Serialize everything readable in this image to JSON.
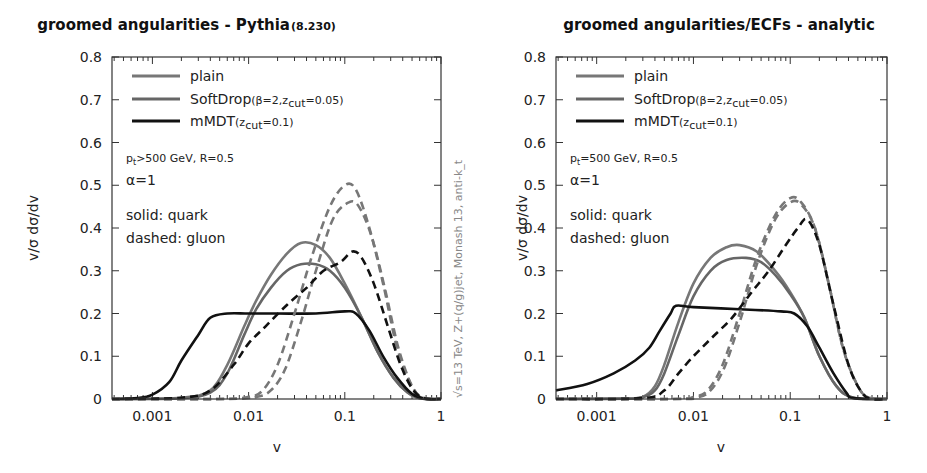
{
  "chart_data": [
    {
      "type": "line",
      "title": "groomed angularities - Pythia",
      "title_suffix": "(8.230)",
      "xlabel": "v",
      "ylabel": "v/σ dσ/dv",
      "xscale": "log",
      "xlim": [
        0.00038,
        1.0
      ],
      "ylim": [
        0,
        0.8
      ],
      "xticks": [
        "0.001",
        "0.01",
        "0.1",
        "1"
      ],
      "yticks": [
        "0",
        "0.1",
        "0.2",
        "0.3",
        "0.4",
        "0.5",
        "0.6",
        "0.7",
        "0.8"
      ],
      "legend": [
        {
          "label": "plain",
          "sub": "",
          "color": "#777777",
          "width": 3
        },
        {
          "label": "SoftDrop",
          "sub": "(β=2,z_cut=0.05)",
          "color": "#666666",
          "width": 3
        },
        {
          "label": "mMDT",
          "sub": "(z_cut=0.1)",
          "color": "#111111",
          "width": 3
        }
      ],
      "annotations": [
        "p_t>500 GeV, R=0.5",
        "α=1",
        "solid: quark",
        "dashed: gluon"
      ],
      "side_note": "√s=13 TeV, Z+(q/g)jet, Monash 13, anti-k_t",
      "series": [
        {
          "name": "plain quark",
          "color": "#777777",
          "dashed": false,
          "points": [
            [
              0.00038,
              0
            ],
            [
              0.002,
              0.003
            ],
            [
              0.004,
              0.02
            ],
            [
              0.006,
              0.08
            ],
            [
              0.009,
              0.17
            ],
            [
              0.012,
              0.23
            ],
            [
              0.017,
              0.29
            ],
            [
              0.025,
              0.34
            ],
            [
              0.035,
              0.365
            ],
            [
              0.05,
              0.36
            ],
            [
              0.07,
              0.33
            ],
            [
              0.1,
              0.27
            ],
            [
              0.15,
              0.19
            ],
            [
              0.22,
              0.11
            ],
            [
              0.32,
              0.05
            ],
            [
              0.45,
              0.015
            ],
            [
              0.6,
              0.002
            ],
            [
              1.0,
              0
            ]
          ]
        },
        {
          "name": "SoftDrop quark",
          "color": "#666666",
          "dashed": false,
          "points": [
            [
              0.00038,
              0
            ],
            [
              0.002,
              0.002
            ],
            [
              0.004,
              0.015
            ],
            [
              0.006,
              0.06
            ],
            [
              0.009,
              0.15
            ],
            [
              0.012,
              0.21
            ],
            [
              0.017,
              0.26
            ],
            [
              0.025,
              0.3
            ],
            [
              0.035,
              0.315
            ],
            [
              0.05,
              0.315
            ],
            [
              0.07,
              0.3
            ],
            [
              0.1,
              0.26
            ],
            [
              0.15,
              0.19
            ],
            [
              0.22,
              0.11
            ],
            [
              0.32,
              0.05
            ],
            [
              0.45,
              0.015
            ],
            [
              0.6,
              0.002
            ],
            [
              1.0,
              0
            ]
          ]
        },
        {
          "name": "mMDT quark",
          "color": "#111111",
          "dashed": false,
          "points": [
            [
              0.00038,
              0
            ],
            [
              0.0007,
              0.002
            ],
            [
              0.001,
              0.01
            ],
            [
              0.0015,
              0.04
            ],
            [
              0.002,
              0.09
            ],
            [
              0.003,
              0.15
            ],
            [
              0.004,
              0.19
            ],
            [
              0.006,
              0.2
            ],
            [
              0.01,
              0.2
            ],
            [
              0.02,
              0.2
            ],
            [
              0.05,
              0.2
            ],
            [
              0.1,
              0.205
            ],
            [
              0.13,
              0.2
            ],
            [
              0.18,
              0.16
            ],
            [
              0.25,
              0.1
            ],
            [
              0.35,
              0.05
            ],
            [
              0.5,
              0.012
            ],
            [
              0.7,
              0
            ],
            [
              1.0,
              0
            ]
          ]
        },
        {
          "name": "plain gluon",
          "color": "#777777",
          "dashed": true,
          "points": [
            [
              0.00038,
              0
            ],
            [
              0.005,
              0
            ],
            [
              0.01,
              0.005
            ],
            [
              0.014,
              0.02
            ],
            [
              0.02,
              0.08
            ],
            [
              0.03,
              0.2
            ],
            [
              0.045,
              0.33
            ],
            [
              0.07,
              0.45
            ],
            [
              0.1,
              0.5
            ],
            [
              0.13,
              0.49
            ],
            [
              0.18,
              0.4
            ],
            [
              0.25,
              0.27
            ],
            [
              0.35,
              0.12
            ],
            [
              0.5,
              0.03
            ],
            [
              0.65,
              0.003
            ],
            [
              1.0,
              0
            ]
          ]
        },
        {
          "name": "SoftDrop gluon",
          "color": "#777777",
          "dashed": true,
          "points": [
            [
              0.00038,
              0
            ],
            [
              0.006,
              0
            ],
            [
              0.012,
              0.005
            ],
            [
              0.017,
              0.02
            ],
            [
              0.024,
              0.07
            ],
            [
              0.035,
              0.18
            ],
            [
              0.05,
              0.3
            ],
            [
              0.075,
              0.42
            ],
            [
              0.11,
              0.46
            ],
            [
              0.14,
              0.45
            ],
            [
              0.19,
              0.38
            ],
            [
              0.26,
              0.26
            ],
            [
              0.36,
              0.12
            ],
            [
              0.5,
              0.03
            ],
            [
              0.65,
              0.003
            ],
            [
              1.0,
              0
            ]
          ]
        },
        {
          "name": "mMDT gluon",
          "color": "#111111",
          "dashed": true,
          "points": [
            [
              0.00038,
              0
            ],
            [
              0.002,
              0.003
            ],
            [
              0.004,
              0.02
            ],
            [
              0.007,
              0.08
            ],
            [
              0.01,
              0.13
            ],
            [
              0.015,
              0.17
            ],
            [
              0.025,
              0.22
            ],
            [
              0.04,
              0.26
            ],
            [
              0.06,
              0.3
            ],
            [
              0.09,
              0.32
            ],
            [
              0.12,
              0.345
            ],
            [
              0.15,
              0.33
            ],
            [
              0.2,
              0.27
            ],
            [
              0.28,
              0.17
            ],
            [
              0.38,
              0.08
            ],
            [
              0.5,
              0.025
            ],
            [
              0.65,
              0.002
            ],
            [
              1.0,
              0
            ]
          ]
        }
      ]
    },
    {
      "type": "line",
      "title": "groomed angularities/ECFs - analytic",
      "xlabel": "v",
      "ylabel": "v/σ dσ/dv",
      "xscale": "log",
      "xlim": [
        0.00038,
        1.0
      ],
      "ylim": [
        0,
        0.8
      ],
      "xticks": [
        "0.001",
        "0.01",
        "0.1",
        "1"
      ],
      "yticks": [
        "0",
        "0.1",
        "0.2",
        "0.3",
        "0.4",
        "0.5",
        "0.6",
        "0.7",
        "0.8"
      ],
      "legend": [
        {
          "label": "plain",
          "sub": "",
          "color": "#777777",
          "width": 3
        },
        {
          "label": "SoftDrop",
          "sub": "(β=2,z_cut=0.05)",
          "color": "#666666",
          "width": 3
        },
        {
          "label": "mMDT",
          "sub": "(z_cut=0.1)",
          "color": "#111111",
          "width": 3
        }
      ],
      "annotations": [
        "p_t=500 GeV, R=0.5",
        "α=1",
        "solid: quark",
        "dashed: gluon"
      ],
      "series": [
        {
          "name": "plain quark",
          "color": "#777777",
          "dashed": false,
          "points": [
            [
              0.00038,
              0
            ],
            [
              0.002,
              0.001
            ],
            [
              0.003,
              0.005
            ],
            [
              0.004,
              0.03
            ],
            [
              0.005,
              0.08
            ],
            [
              0.007,
              0.18
            ],
            [
              0.01,
              0.27
            ],
            [
              0.015,
              0.33
            ],
            [
              0.022,
              0.355
            ],
            [
              0.03,
              0.36
            ],
            [
              0.045,
              0.345
            ],
            [
              0.07,
              0.3
            ],
            [
              0.1,
              0.25
            ],
            [
              0.14,
              0.19
            ],
            [
              0.2,
              0.1
            ],
            [
              0.3,
              0.03
            ],
            [
              0.45,
              0.003
            ],
            [
              1.0,
              0
            ]
          ]
        },
        {
          "name": "SoftDrop quark",
          "color": "#666666",
          "dashed": false,
          "points": [
            [
              0.00038,
              0
            ],
            [
              0.002,
              0.001
            ],
            [
              0.003,
              0.004
            ],
            [
              0.004,
              0.02
            ],
            [
              0.005,
              0.06
            ],
            [
              0.007,
              0.15
            ],
            [
              0.01,
              0.24
            ],
            [
              0.015,
              0.3
            ],
            [
              0.022,
              0.325
            ],
            [
              0.035,
              0.33
            ],
            [
              0.05,
              0.32
            ],
            [
              0.07,
              0.29
            ],
            [
              0.1,
              0.245
            ],
            [
              0.14,
              0.19
            ],
            [
              0.2,
              0.1
            ],
            [
              0.3,
              0.03
            ],
            [
              0.45,
              0.003
            ],
            [
              1.0,
              0
            ]
          ]
        },
        {
          "name": "mMDT quark",
          "color": "#111111",
          "dashed": false,
          "points": [
            [
              0.00038,
              0.02
            ],
            [
              0.0008,
              0.035
            ],
            [
              0.0015,
              0.06
            ],
            [
              0.0025,
              0.09
            ],
            [
              0.0035,
              0.12
            ],
            [
              0.0045,
              0.16
            ],
            [
              0.0058,
              0.2
            ],
            [
              0.0066,
              0.218
            ],
            [
              0.01,
              0.215
            ],
            [
              0.03,
              0.21
            ],
            [
              0.08,
              0.205
            ],
            [
              0.11,
              0.2
            ],
            [
              0.15,
              0.17
            ],
            [
              0.2,
              0.12
            ],
            [
              0.28,
              0.06
            ],
            [
              0.38,
              0.015
            ],
            [
              0.45,
              0.002
            ],
            [
              1.0,
              0
            ]
          ]
        },
        {
          "name": "plain gluon",
          "color": "#777777",
          "dashed": true,
          "points": [
            [
              0.00038,
              0
            ],
            [
              0.006,
              0
            ],
            [
              0.01,
              0.005
            ],
            [
              0.014,
              0.02
            ],
            [
              0.02,
              0.08
            ],
            [
              0.03,
              0.2
            ],
            [
              0.045,
              0.33
            ],
            [
              0.07,
              0.43
            ],
            [
              0.1,
              0.47
            ],
            [
              0.13,
              0.46
            ],
            [
              0.18,
              0.4
            ],
            [
              0.25,
              0.27
            ],
            [
              0.35,
              0.12
            ],
            [
              0.5,
              0.03
            ],
            [
              0.65,
              0.003
            ],
            [
              1.0,
              0
            ]
          ]
        },
        {
          "name": "SoftDrop gluon",
          "color": "#777777",
          "dashed": true,
          "points": [
            [
              0.00038,
              0
            ],
            [
              0.007,
              0
            ],
            [
              0.011,
              0.004
            ],
            [
              0.015,
              0.02
            ],
            [
              0.021,
              0.075
            ],
            [
              0.031,
              0.19
            ],
            [
              0.046,
              0.32
            ],
            [
              0.07,
              0.42
            ],
            [
              0.1,
              0.46
            ],
            [
              0.13,
              0.455
            ],
            [
              0.18,
              0.4
            ],
            [
              0.25,
              0.27
            ],
            [
              0.35,
              0.12
            ],
            [
              0.5,
              0.03
            ],
            [
              0.65,
              0.003
            ],
            [
              1.0,
              0
            ]
          ]
        },
        {
          "name": "mMDT gluon",
          "color": "#111111",
          "dashed": true,
          "points": [
            [
              0.00038,
              0
            ],
            [
              0.003,
              0.002
            ],
            [
              0.005,
              0.02
            ],
            [
              0.007,
              0.06
            ],
            [
              0.01,
              0.1
            ],
            [
              0.015,
              0.14
            ],
            [
              0.025,
              0.19
            ],
            [
              0.04,
              0.25
            ],
            [
              0.06,
              0.3
            ],
            [
              0.09,
              0.36
            ],
            [
              0.12,
              0.4
            ],
            [
              0.15,
              0.42
            ],
            [
              0.2,
              0.36
            ],
            [
              0.28,
              0.22
            ],
            [
              0.4,
              0.08
            ],
            [
              0.55,
              0.015
            ],
            [
              0.7,
              0
            ],
            [
              1.0,
              0
            ]
          ]
        }
      ]
    }
  ]
}
